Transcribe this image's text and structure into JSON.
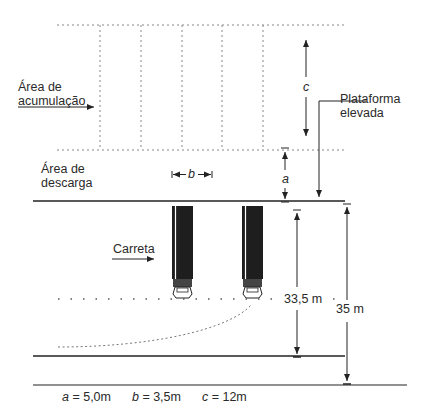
{
  "diagram": {
    "title": "",
    "labels": {
      "accumulation_area": [
        "Área de",
        "acumulação"
      ],
      "unloading_area": [
        "Área de",
        "descarga"
      ],
      "elevated_platform": [
        "Plataforma",
        "elevada"
      ],
      "truck": "Carreta",
      "dim_a": "a",
      "dim_b": "b",
      "dim_c": "c",
      "dim_inner": "33,5 m",
      "dim_outer": "35 m"
    },
    "legend": {
      "a": {
        "symbol": "a",
        "value": " = 5,0m"
      },
      "b": {
        "symbol": "b",
        "value": " = 3,5m"
      },
      "c": {
        "symbol": "c",
        "value": " = 12m"
      }
    },
    "elements": {
      "accumulation_bays": 5,
      "trucks": 2
    },
    "colors": {
      "line": "#222222",
      "dotted": "#888888",
      "truck_body": "#1e1e1e"
    }
  }
}
